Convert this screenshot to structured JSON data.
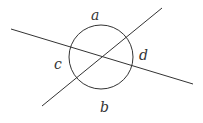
{
  "diagram": {
    "type": "geometry",
    "stroke_color": "#333333",
    "circle": {
      "cx": 101,
      "cy": 57,
      "r": 32
    },
    "lines": [
      {
        "x1": 11,
        "y1": 29,
        "x2": 193,
        "y2": 84
      },
      {
        "x1": 162,
        "y1": 8,
        "x2": 42,
        "y2": 106
      }
    ],
    "labels": [
      {
        "text": "a",
        "x": 91,
        "y": 20
      },
      {
        "text": "c",
        "x": 54,
        "y": 69
      },
      {
        "text": "d",
        "x": 139,
        "y": 60
      },
      {
        "text": "b",
        "x": 100,
        "y": 112
      }
    ]
  }
}
